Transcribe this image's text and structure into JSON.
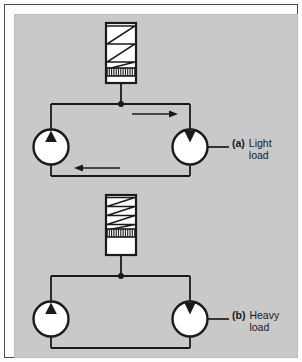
{
  "figure": {
    "background_color": "#c9c9c9",
    "line_color": "#1a1a1a",
    "fill_color": "#ffffff",
    "border_color": "#4a4a4a"
  },
  "circuits": [
    {
      "id": "a",
      "tag": "(a)",
      "label_line1": "Light",
      "label_line2": "load",
      "accumulator": {
        "name": "spring-loaded-accumulator",
        "spring_state": "extended",
        "spring_zigzags": 3,
        "piston_position": "low",
        "piston_hatch_count": 11
      },
      "pump": {
        "name": "pump",
        "arrow_direction": "up"
      },
      "motor": {
        "name": "motor",
        "arrow_direction": "down"
      },
      "flow_arrows": [
        {
          "name": "flow-arrow-supply",
          "direction": "right",
          "position": "top"
        },
        {
          "name": "flow-arrow-return",
          "direction": "left",
          "position": "bottom"
        }
      ],
      "junction": {
        "name": "junction-dot",
        "visible": true
      }
    },
    {
      "id": "b",
      "tag": "(b)",
      "label_line1": "Heavy",
      "label_line2": "load",
      "accumulator": {
        "name": "spring-loaded-accumulator",
        "spring_state": "compressed",
        "spring_zigzags": 4,
        "piston_position": "high",
        "piston_hatch_count": 11
      },
      "pump": {
        "name": "pump",
        "arrow_direction": "up"
      },
      "motor": {
        "name": "motor",
        "arrow_direction": "down"
      },
      "flow_arrows": [],
      "junction": {
        "name": "junction-dot",
        "visible": true
      }
    }
  ]
}
